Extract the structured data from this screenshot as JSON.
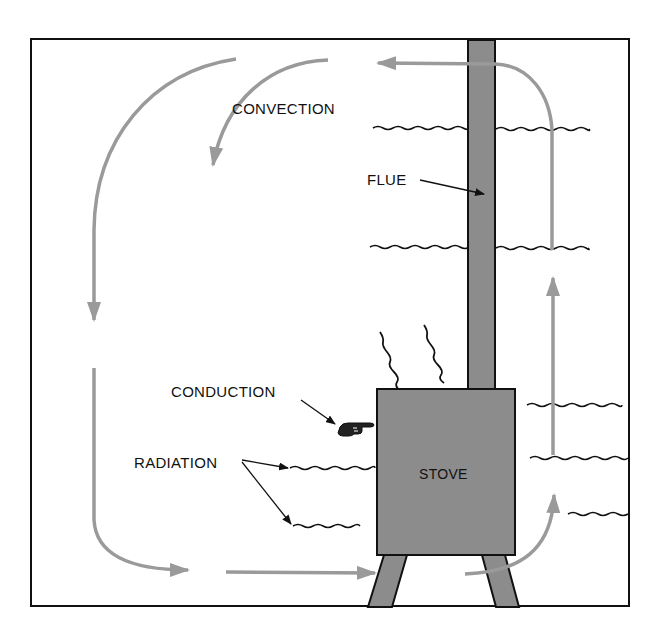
{
  "diagram": {
    "labels": {
      "convection": "CONVECTION",
      "flue": "FLUE",
      "conduction": "CONDUCTION",
      "radiation": "RADIATION",
      "stove": "STOVE"
    },
    "colors": {
      "frame": "#111111",
      "stove_fill": "#8c8c8c",
      "convection_arrow": "#9a9a9a",
      "wave_lines": "#111111",
      "background": "#ffffff"
    },
    "icons": {
      "conduction_pointer": "pointing-hand-icon"
    }
  }
}
